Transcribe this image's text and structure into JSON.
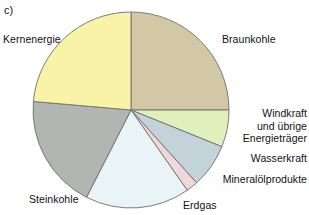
{
  "figure": {
    "part_label": "c)",
    "clipped_header_text": "",
    "background_color": "#ffffff"
  },
  "chart_data": {
    "type": "pie",
    "title": "",
    "xlabel": "",
    "ylabel": "",
    "legend_position": "callout-labels",
    "grid": false,
    "start_angle_deg": 0,
    "direction": "clockwise",
    "center": {
      "x": 131,
      "y": 110
    },
    "radius": 98,
    "categories": [
      "Braunkohle",
      "Windkraft und übrige Energieträger",
      "Wasserkraft",
      "Mineralölprodukte",
      "Erdgas",
      "Steinkohle",
      "Kernenergie"
    ],
    "values": [
      25.0,
      6.1,
      7.2,
      1.9,
      17.2,
      18.9,
      23.7
    ],
    "angles_deg": [
      90.0,
      22.0,
      26.0,
      7.0,
      62.0,
      68.0,
      85.0
    ],
    "colors": [
      "#d3c8a6",
      "#dff0bc",
      "#c4d2da",
      "#f0d7d9",
      "#e9f4f6",
      "#b3b5b3",
      "#f9f3a8"
    ],
    "slice_stroke": "#6e6e6e",
    "slices": [
      {
        "label": "Braunkohle",
        "value": 25.0,
        "color": "#d3c8a6"
      },
      {
        "label": "Windkraft und übrige Energieträger",
        "value": 6.1,
        "color": "#dff0bc"
      },
      {
        "label": "Wasserkraft",
        "value": 7.2,
        "color": "#c4d2da"
      },
      {
        "label": "Mineralölprodukte",
        "value": 1.9,
        "color": "#f0d7d9"
      },
      {
        "label": "Erdgas",
        "value": 17.2,
        "color": "#e9f4f6"
      },
      {
        "label": "Steinkohle",
        "value": 18.9,
        "color": "#b3b5b3"
      },
      {
        "label": "Kernenergie",
        "value": 23.7,
        "color": "#f9f3a8"
      }
    ]
  },
  "labels": {
    "braunkohle": "Braunkohle",
    "windkraft_line1": "Windkraft",
    "windkraft_line2": "und übrige",
    "windkraft_line3": "Energieträger",
    "wasserkraft": "Wasserkraft",
    "mineraloelprodukte": "Mineralölprodukte",
    "erdgas": "Erdgas",
    "steinkohle": "Steinkohle",
    "kernenergie": "Kernenergie"
  }
}
